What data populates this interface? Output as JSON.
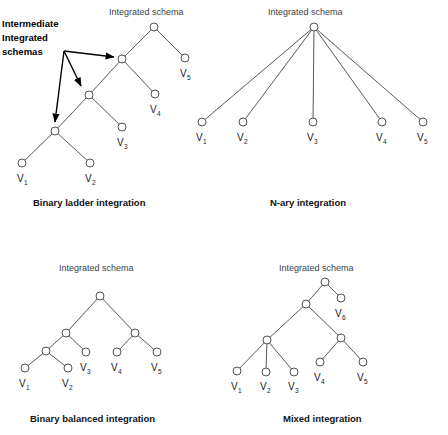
{
  "figure": {
    "background_color": "#ffffff",
    "node_stroke_color": "#4f5457",
    "edge_color": "#555a5e",
    "arrow_color": "#000000",
    "annotation": {
      "line1": "Intermediate",
      "line2": "Integrated",
      "line3": "schemas"
    }
  },
  "panels": [
    {
      "id": "binary-ladder",
      "title": "Integrated schema",
      "caption": "Binary ladder integration",
      "leaves": [
        "V",
        "V",
        "V",
        "V",
        "V"
      ],
      "leaf_labels": [
        {
          "name": "V",
          "sub": "1"
        },
        {
          "name": "V",
          "sub": "2"
        },
        {
          "name": "V",
          "sub": "3"
        },
        {
          "name": "V",
          "sub": "4"
        },
        {
          "name": "V",
          "sub": "5"
        }
      ],
      "internal_node_count": 3,
      "structure": "left-deep binary ladder"
    },
    {
      "id": "n-ary",
      "title": "Integrated schema",
      "caption": "N-ary integration",
      "leaf_labels": [
        {
          "name": "V",
          "sub": "1"
        },
        {
          "name": "V",
          "sub": "2"
        },
        {
          "name": "V",
          "sub": "3"
        },
        {
          "name": "V",
          "sub": "4"
        },
        {
          "name": "V",
          "sub": "5"
        }
      ],
      "internal_node_count": 0,
      "structure": "single root with five direct children"
    },
    {
      "id": "binary-balanced",
      "title": "Integrated schema",
      "caption": "Binary balanced integration",
      "leaf_labels": [
        {
          "name": "V",
          "sub": "1"
        },
        {
          "name": "V",
          "sub": "2"
        },
        {
          "name": "V",
          "sub": "3"
        },
        {
          "name": "V",
          "sub": "4"
        },
        {
          "name": "V",
          "sub": "5"
        }
      ],
      "internal_node_count": 3,
      "structure": "balanced binary tree"
    },
    {
      "id": "mixed",
      "title": "Integrated schema",
      "caption": "Mixed integration",
      "leaf_labels": [
        {
          "name": "V",
          "sub": "1"
        },
        {
          "name": "V",
          "sub": "2"
        },
        {
          "name": "V",
          "sub": "3"
        },
        {
          "name": "V",
          "sub": "4"
        },
        {
          "name": "V",
          "sub": "5"
        },
        {
          "name": "V",
          "sub": "6"
        }
      ],
      "internal_node_count": 2,
      "structure": "mix of n-ary and binary merges"
    }
  ]
}
